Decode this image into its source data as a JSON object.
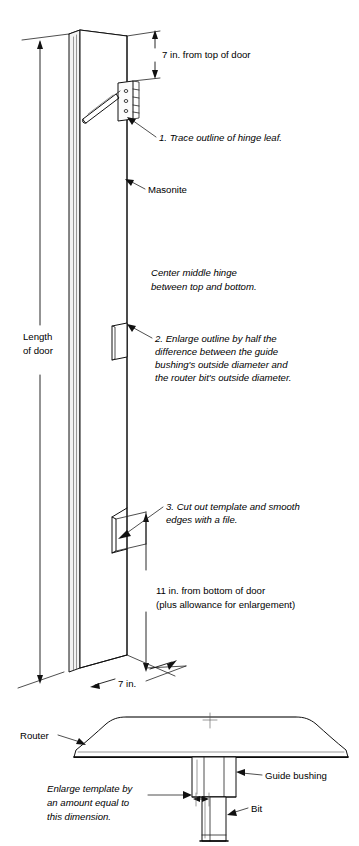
{
  "figure": {
    "background_color": "#ffffff",
    "line_color": "#111111",
    "width": 359,
    "height": 846
  },
  "panel_view": {
    "name": "Masonite template board, perspective view",
    "labels": {
      "length_of_door_line1": "Length",
      "length_of_door_line2": "of door",
      "masonite": "Masonite",
      "top_dimension": "7 in. from top of door",
      "width_dimension": "7 in.",
      "bottom_dimension_line1": "11 in. from bottom of door",
      "bottom_dimension_line2": "(plus allowance for enlargement)",
      "center_note_line1": "Center middle hinge",
      "center_note_line2": "between top and bottom."
    },
    "steps": [
      {
        "number": "1.",
        "text": "1. Trace outline of hinge leaf.",
        "target": "top hinge leaf"
      },
      {
        "number": "2.",
        "text_line1": "2. Enlarge outline by half the",
        "text_line2": "difference between the guide",
        "text_line3": "bushing's outside diameter and",
        "text_line4": "the router bit's outside diameter.",
        "target": "middle hinge outline"
      },
      {
        "number": "3.",
        "text_line1": "3. Cut out template and smooth",
        "text_line2": "edges with a file.",
        "target": "bottom hinge cutout"
      }
    ],
    "parts": {
      "hinge_leaf": "hinge leaf",
      "pencil": "pencil",
      "middle_outline": "middle hinge outline",
      "bottom_cutout": "bottom hinge cutout"
    }
  },
  "router_view": {
    "name": "Router with guide bushing and bit, side section view",
    "labels": {
      "router": "Router",
      "guide_bushing": "Guide bushing",
      "bit": "Bit",
      "enlarge_note_line1": "Enlarge template by",
      "enlarge_note_line2": "an amount equal to",
      "enlarge_note_line3": "this dimension."
    }
  }
}
